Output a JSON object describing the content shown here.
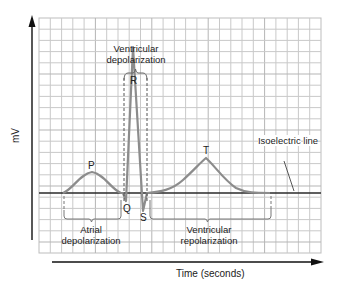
{
  "diagram": {
    "axes": {
      "y_label": "mV",
      "x_label": "Time (seconds)"
    },
    "waves": {
      "P": "P",
      "Q": "Q",
      "R": "R",
      "S": "S",
      "T": "T"
    },
    "annotations": {
      "ventricular_depolarization": [
        "Ventricular",
        "depolarization"
      ],
      "atrial_depolarization": [
        "Atrial",
        "depolarization"
      ],
      "ventricular_repolarization": [
        "Ventricular",
        "repolarization"
      ],
      "isoelectric_line": [
        "Isoelectric",
        "line"
      ]
    },
    "colors": {
      "grid": "#c8c8c8",
      "trace": "#8a8a8a",
      "baseline": "#2a2a2a",
      "axis": "#111111",
      "brackets": "#777777"
    }
  }
}
